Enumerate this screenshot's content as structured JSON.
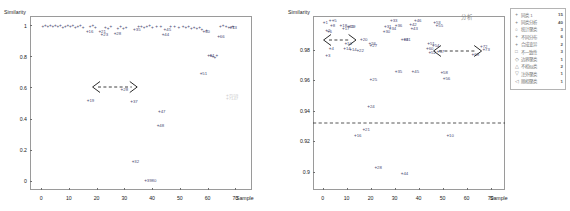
{
  "chart_data": [
    {
      "type": "scatter",
      "panel": "left",
      "title": "",
      "ylabel": "Similarity",
      "xlabel": "Sample",
      "xlim": [
        -4,
        76
      ],
      "ylim": [
        -0.06,
        1.06
      ],
      "xticks": [
        "0",
        "10",
        "20",
        "30",
        "40",
        "50",
        "60",
        "70"
      ],
      "xtick_values": [
        0,
        10,
        20,
        30,
        40,
        50,
        60,
        70
      ],
      "yticks": [
        "0",
        "0.2",
        "0.4",
        "0.6",
        "0.8",
        "1"
      ],
      "ytick_values": [
        0,
        0.2,
        0.4,
        0.6,
        0.8,
        1
      ],
      "grid": false,
      "marker": "+",
      "points": [
        {
          "label": "",
          "x": 0.5,
          "y": 0.992
        },
        {
          "label": "",
          "x": 1.4,
          "y": 0.996
        },
        {
          "label": "",
          "x": 2.3,
          "y": 0.99
        },
        {
          "label": "",
          "x": 3.2,
          "y": 0.995
        },
        {
          "label": "",
          "x": 4.1,
          "y": 0.986
        },
        {
          "label": "",
          "x": 5.0,
          "y": 0.993
        },
        {
          "label": "",
          "x": 5.9,
          "y": 0.988
        },
        {
          "label": "",
          "x": 6.8,
          "y": 0.997
        },
        {
          "label": "",
          "x": 7.7,
          "y": 0.984
        },
        {
          "label": "",
          "x": 8.6,
          "y": 0.991
        },
        {
          "label": "",
          "x": 9.5,
          "y": 0.995
        },
        {
          "label": "",
          "x": 10.4,
          "y": 0.987
        },
        {
          "label": "",
          "x": 11.3,
          "y": 0.993
        },
        {
          "label": "",
          "x": 12.2,
          "y": 0.982
        },
        {
          "label": "",
          "x": 13.1,
          "y": 0.99
        },
        {
          "label": "",
          "x": 14.0,
          "y": 0.996
        },
        {
          "label": "",
          "x": 15.0,
          "y": 0.985
        },
        {
          "label": "16",
          "x": 16.5,
          "y": 0.955
        },
        {
          "label": "",
          "x": 17.5,
          "y": 0.988
        },
        {
          "label": "",
          "x": 18.5,
          "y": 0.993
        },
        {
          "label": "",
          "x": 19.4,
          "y": 0.98
        },
        {
          "label": "21",
          "x": 21.0,
          "y": 0.955
        },
        {
          "label": "23",
          "x": 21.8,
          "y": 0.94
        },
        {
          "label": "",
          "x": 23.0,
          "y": 0.983
        },
        {
          "label": "",
          "x": 24.0,
          "y": 0.975
        },
        {
          "label": "",
          "x": 25.0,
          "y": 0.989
        },
        {
          "label": "28",
          "x": 26.5,
          "y": 0.942
        },
        {
          "label": "",
          "x": 27.5,
          "y": 0.979
        },
        {
          "label": "",
          "x": 28.5,
          "y": 0.986
        },
        {
          "label": "",
          "x": 29.5,
          "y": 0.975
        },
        {
          "label": "",
          "x": 30.5,
          "y": 0.982
        },
        {
          "label": "35",
          "x": 33.5,
          "y": 0.968
        },
        {
          "label": "",
          "x": 35.0,
          "y": 0.986
        },
        {
          "label": "",
          "x": 36.0,
          "y": 0.99
        },
        {
          "label": "",
          "x": 37.0,
          "y": 0.982
        },
        {
          "label": "",
          "x": 38.0,
          "y": 0.988
        },
        {
          "label": "",
          "x": 39.0,
          "y": 0.993
        },
        {
          "label": "",
          "x": 40.0,
          "y": 0.985
        },
        {
          "label": "",
          "x": 41.5,
          "y": 0.991
        },
        {
          "label": "",
          "x": 43.0,
          "y": 0.987
        },
        {
          "label": "45",
          "x": 44.5,
          "y": 0.968
        },
        {
          "label": "44",
          "x": 43.8,
          "y": 0.94
        },
        {
          "label": "",
          "x": 46.5,
          "y": 0.989
        },
        {
          "label": "",
          "x": 48.0,
          "y": 0.992
        },
        {
          "label": "",
          "x": 49.5,
          "y": 0.985
        },
        {
          "label": "",
          "x": 51.0,
          "y": 0.99
        },
        {
          "label": "",
          "x": 52.0,
          "y": 0.983
        },
        {
          "label": "",
          "x": 53.0,
          "y": 0.988
        },
        {
          "label": "",
          "x": 54.0,
          "y": 0.979
        },
        {
          "label": "",
          "x": 55.0,
          "y": 0.985
        },
        {
          "label": "",
          "x": 56.0,
          "y": 0.974
        },
        {
          "label": "",
          "x": 57.0,
          "y": 0.981
        },
        {
          "label": "",
          "x": 57.8,
          "y": 0.97
        },
        {
          "label": "60",
          "x": 58.5,
          "y": 0.957
        },
        {
          "label": "",
          "x": 59.5,
          "y": 0.965
        },
        {
          "label": "61",
          "x": 60.2,
          "y": 0.805
        },
        {
          "label": "",
          "x": 61.0,
          "y": 0.8
        },
        {
          "label": "",
          "x": 61.8,
          "y": 0.795
        },
        {
          "label": "",
          "x": 62.5,
          "y": 0.792
        },
        {
          "label": "",
          "x": 63.2,
          "y": 0.8
        },
        {
          "label": "66",
          "x": 63.8,
          "y": 0.928
        },
        {
          "label": "",
          "x": 64.5,
          "y": 0.99
        },
        {
          "label": "",
          "x": 65.5,
          "y": 0.994
        },
        {
          "label": "",
          "x": 66.5,
          "y": 0.988
        },
        {
          "label": "71",
          "x": 67.5,
          "y": 0.985
        },
        {
          "label": "73",
          "x": 68.2,
          "y": 0.98
        },
        {
          "label": "",
          "x": 69.0,
          "y": 0.992
        },
        {
          "label": "51",
          "x": 57.5,
          "y": 0.685
        },
        {
          "label": "28",
          "x": 29.0,
          "y": 0.585
        },
        {
          "label": "19",
          "x": 16.8,
          "y": 0.51
        },
        {
          "label": "37",
          "x": 32.5,
          "y": 0.505
        },
        {
          "label": "47",
          "x": 42.5,
          "y": 0.445
        },
        {
          "label": "48",
          "x": 42.0,
          "y": 0.355
        },
        {
          "label": "32",
          "x": 33.0,
          "y": 0.12
        },
        {
          "label": "3980",
          "x": 37.5,
          "y": 0.0
        }
      ],
      "gray_points": [
        {
          "label": "7559",
          "x": 67.0,
          "y": 0.545
        },
        {
          "label": "7147",
          "x": 67.0,
          "y": 0.525
        }
      ],
      "annotations": [
        {
          "type": "double-arrow-dashed",
          "x1": 18.5,
          "x2": 35.0,
          "y": 0.6
        }
      ]
    },
    {
      "type": "scatter",
      "panel": "right",
      "title": "",
      "ylabel": "Similarity",
      "xlabel": "Sample",
      "xlim": [
        -4,
        76
      ],
      "ylim": [
        0.888,
        1.002
      ],
      "xticks": [
        "0",
        "10",
        "20",
        "30",
        "40",
        "50",
        "60",
        "70"
      ],
      "xtick_values": [
        0,
        10,
        20,
        30,
        40,
        50,
        60,
        70
      ],
      "yticks": [
        "0.9",
        "0.92",
        "0.94",
        "0.96",
        "0.98"
      ],
      "ytick_values": [
        0.9,
        0.92,
        0.94,
        0.96,
        0.98
      ],
      "grid": false,
      "marker": "+",
      "points": [
        {
          "label": "1",
          "x": 0.5,
          "y": 0.9975
        },
        {
          "label": "",
          "x": 3.0,
          "y": 0.9985
        },
        {
          "label": "5",
          "x": 4.2,
          "y": 0.9985
        },
        {
          "label": "8",
          "x": 3.5,
          "y": 0.9955
        },
        {
          "label": "18",
          "x": 7.5,
          "y": 0.9955
        },
        {
          "label": "2",
          "x": 1.5,
          "y": 0.9925
        },
        {
          "label": "6",
          "x": 2.2,
          "y": 0.9918
        },
        {
          "label": "15",
          "x": 10.5,
          "y": 0.9945
        },
        {
          "label": "19",
          "x": 11.0,
          "y": 0.9948
        },
        {
          "label": "17",
          "x": 8.5,
          "y": 0.9932
        },
        {
          "label": "20",
          "x": 16.0,
          "y": 0.9862
        },
        {
          "label": "10",
          "x": 9.5,
          "y": 0.9838
        },
        {
          "label": "4",
          "x": 3.0,
          "y": 0.9805
        },
        {
          "label": "14",
          "x": 9.0,
          "y": 0.9802
        },
        {
          "label": "14",
          "x": 11.5,
          "y": 0.98
        },
        {
          "label": "22",
          "x": 14.5,
          "y": 0.9788
        },
        {
          "label": "26",
          "x": 19.5,
          "y": 0.9838
        },
        {
          "label": "27",
          "x": 20.0,
          "y": 0.9822
        },
        {
          "label": "3",
          "x": 1.5,
          "y": 0.9755
        },
        {
          "label": "33",
          "x": 28.5,
          "y": 0.9985
        },
        {
          "label": "31",
          "x": 26.0,
          "y": 0.9945
        },
        {
          "label": "36",
          "x": 30.5,
          "y": 0.9952
        },
        {
          "label": "34",
          "x": 28.0,
          "y": 0.9935
        },
        {
          "label": "30",
          "x": 25.5,
          "y": 0.9918
        },
        {
          "label": "42",
          "x": 36.5,
          "y": 0.9958
        },
        {
          "label": "46",
          "x": 38.5,
          "y": 0.9988
        },
        {
          "label": "43",
          "x": 37.0,
          "y": 0.9935
        },
        {
          "label": "41",
          "x": 34.0,
          "y": 0.9862
        },
        {
          "label": "39",
          "x": 33.0,
          "y": 0.9862
        },
        {
          "label": "53",
          "x": 46.5,
          "y": 0.9975
        },
        {
          "label": "55",
          "x": 47.5,
          "y": 0.9955
        },
        {
          "label": "51",
          "x": 44.0,
          "y": 0.9835
        },
        {
          "label": "54",
          "x": 46.0,
          "y": 0.9822
        },
        {
          "label": "60",
          "x": 43.5,
          "y": 0.9802
        },
        {
          "label": "52",
          "x": 44.5,
          "y": 0.9775
        },
        {
          "label": "57",
          "x": 48.0,
          "y": 0.9782
        },
        {
          "label": "72",
          "x": 66.0,
          "y": 0.9818
        },
        {
          "label": "73",
          "x": 67.0,
          "y": 0.9795
        },
        {
          "label": "69",
          "x": 62.5,
          "y": 0.9765
        },
        {
          "label": "35",
          "x": 30.5,
          "y": 0.9655
        },
        {
          "label": "45",
          "x": 37.5,
          "y": 0.9652
        },
        {
          "label": "58",
          "x": 49.5,
          "y": 0.9645
        },
        {
          "label": "56",
          "x": 50.5,
          "y": 0.9605
        },
        {
          "label": "25",
          "x": 20.0,
          "y": 0.9598
        },
        {
          "label": "24",
          "x": 19.0,
          "y": 0.9425
        },
        {
          "label": "21",
          "x": 17.0,
          "y": 0.9272
        },
        {
          "label": "16",
          "x": 13.5,
          "y": 0.9232
        },
        {
          "label": "10",
          "x": 52.0,
          "y": 0.9232
        },
        {
          "label": "28",
          "x": 22.0,
          "y": 0.9022
        },
        {
          "label": "44",
          "x": 33.0,
          "y": 0.8988
        }
      ],
      "gray_points": [],
      "annotations": [
        {
          "type": "double-arrow-dashed",
          "x1": 0.0,
          "x2": 14.0,
          "y": 0.9862
        },
        {
          "type": "double-arrow-dashed",
          "x1": 46.0,
          "x2": 66.5,
          "y": 0.9792
        },
        {
          "type": "threshold-line-dashed",
          "y": 0.9322
        }
      ],
      "corner_note": "分析"
    }
  ],
  "legend": {
    "position": "right-outside",
    "rows": [
      {
        "marker": "+",
        "label": "相同 15",
        "name": "同类 1",
        "count": "15"
      },
      {
        "marker": "+",
        "label": "同类分析",
        "name": "同类分析",
        "count": "40"
      },
      {
        "marker": "○",
        "label": "统计聚类",
        "name": "统计聚类",
        "count": "3"
      },
      {
        "marker": "+",
        "label": "不同分布",
        "name": "不同分布",
        "count": "6"
      },
      {
        "marker": "+",
        "label": "合成变异",
        "name": "合成变异",
        "count": "2"
      },
      {
        "marker": "□",
        "label": "不一致性",
        "name": "不一致性",
        "count": "3"
      },
      {
        "marker": "◇",
        "label": "边界聚类",
        "name": "边界聚类",
        "count": "1"
      },
      {
        "marker": "△",
        "label": "不相似类",
        "name": "不相似类",
        "count": "2"
      },
      {
        "marker": "▽",
        "label": "注外聚类",
        "name": "注外聚类",
        "count": "1"
      },
      {
        "marker": "◁",
        "label": "顺相聚类",
        "name": "顺相聚类",
        "count": "1"
      }
    ]
  },
  "colors": {
    "point": "#4a4a72",
    "gray_point": "#cccccc",
    "axis": "#9a9a9a",
    "text": "#1a1a1a",
    "annotation": "#333333",
    "background": "#ffffff"
  }
}
